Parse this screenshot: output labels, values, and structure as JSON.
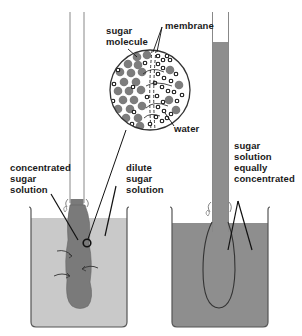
{
  "diagram": {
    "colors": {
      "background": "#ffffff",
      "outline": "#333333",
      "concentrated_solution": "#7a7a7a",
      "dilute_solution": "#c9c9c9",
      "equal_solution": "#8e8e8e",
      "sugar_molecule": "#7d7d7d",
      "water_molecule": "#222222"
    },
    "labels": {
      "sugar_molecule": [
        "sugar",
        "molecule"
      ],
      "membrane": [
        "membrane"
      ],
      "water": [
        "water"
      ],
      "concentrated": [
        "concentrated",
        "sugar",
        "solution"
      ],
      "dilute": [
        "dilute",
        "sugar",
        "solution"
      ],
      "equal": [
        "sugar",
        "solution",
        "equally",
        "concentrated"
      ]
    },
    "panels": [
      {
        "name": "before",
        "description": "Concentrated sugar solution in a membrane bag immersed in dilute sugar solution"
      },
      {
        "name": "after",
        "description": "Sugar solutions equally concentrated; liquid has risen in the tube"
      }
    ]
  }
}
